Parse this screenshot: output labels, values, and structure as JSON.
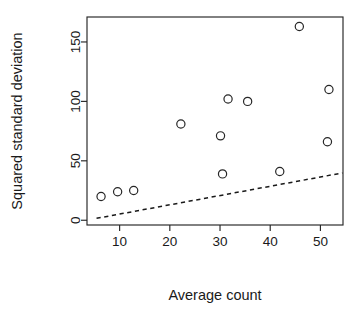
{
  "chart_data": {
    "type": "scatter",
    "title": "",
    "xlabel": "Average count",
    "ylabel": "Squared standard deviation",
    "xlim": [
      3.5,
      54.5
    ],
    "ylim": [
      -4,
      171
    ],
    "xticks": [
      10,
      20,
      30,
      40,
      50
    ],
    "xtick_labels": [
      "10",
      "20",
      "30",
      "40",
      "50"
    ],
    "yticks": [
      0,
      50,
      100,
      150
    ],
    "ytick_labels": [
      "0",
      "50",
      "100",
      "150"
    ],
    "grid": false,
    "legend": false,
    "marker": "open-circle",
    "points": [
      {
        "x": 6.3,
        "y": 20
      },
      {
        "x": 9.6,
        "y": 24
      },
      {
        "x": 12.8,
        "y": 25
      },
      {
        "x": 22.2,
        "y": 81
      },
      {
        "x": 30.1,
        "y": 71
      },
      {
        "x": 30.5,
        "y": 39
      },
      {
        "x": 31.6,
        "y": 102
      },
      {
        "x": 35.5,
        "y": 100
      },
      {
        "x": 41.9,
        "y": 41
      },
      {
        "x": 45.8,
        "y": 163
      },
      {
        "x": 51.7,
        "y": 110
      },
      {
        "x": 51.4,
        "y": 66
      }
    ],
    "trend_line": {
      "style": "dashed",
      "x_start": 5.4,
      "y_start": 1.6,
      "x_end": 54.4,
      "y_end": 39.8
    }
  },
  "figure": {
    "background_color": "#ffffff",
    "foreground_color": "#262626"
  }
}
